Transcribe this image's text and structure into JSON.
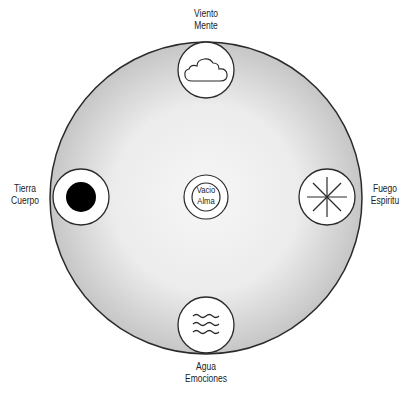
{
  "diagram": {
    "type": "elements-wheel",
    "colors": {
      "outer_fill_edge": "#c9c9c9",
      "outer_fill_center": "#f4f4f4",
      "stroke": "#2a2a2a",
      "icon_fill": "#ffffff",
      "earth_dot": "#000000"
    },
    "elements": {
      "top": {
        "name": "Viento",
        "meaning": "Mente",
        "icon": "cloud-icon"
      },
      "left": {
        "name": "Tierra",
        "meaning": "Cuerpo",
        "icon": "filled-dot-icon"
      },
      "right": {
        "name": "Fuego",
        "meaning": "Espiritu",
        "icon": "asterisk-icon"
      },
      "bottom": {
        "name": "Agua",
        "meaning": "Emociones",
        "icon": "waves-icon"
      },
      "center": {
        "name": "Vacio",
        "meaning": "Alma",
        "icon": "double-ring-icon"
      }
    }
  }
}
